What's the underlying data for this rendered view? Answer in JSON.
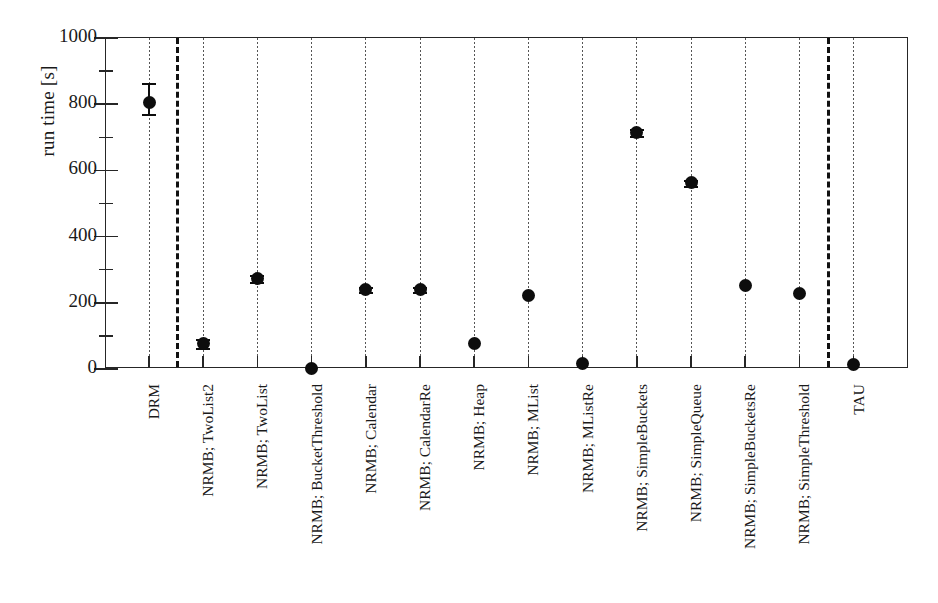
{
  "chart_data": {
    "type": "scatter",
    "title": "",
    "xlabel": "",
    "ylabel": "run time [s]",
    "ylim": [
      0,
      1000
    ],
    "yticks": [
      0,
      200,
      400,
      600,
      800,
      1000
    ],
    "yticks_minor": [
      100,
      300,
      500,
      700,
      900
    ],
    "grid": false,
    "legend": "none",
    "categories": [
      "DRM",
      "NRMB; TwoList2",
      "NRMB; TwoList",
      "NRMB; BucketThreshold",
      "NRMB; Calendar",
      "NRMB; CalendarRe",
      "NRMB; Heap",
      "NRMB; MList",
      "NRMB; MListRe",
      "NRMB; SimpleBuckets",
      "NRMB; SimpleQueue",
      "NRMB; SimpleBucketsRe",
      "NRMB; SimpleThreshold",
      "TAU"
    ],
    "values": [
      805,
      77,
      273,
      3,
      240,
      240,
      77,
      222,
      18,
      715,
      562,
      252,
      227,
      15
    ],
    "err_low": [
      35,
      14,
      10,
      0,
      8,
      8,
      0,
      0,
      0,
      10,
      8,
      0,
      0,
      0
    ],
    "err_high": [
      58,
      14,
      10,
      0,
      8,
      8,
      0,
      0,
      0,
      10,
      8,
      0,
      0,
      0
    ],
    "separators_after": [
      "DRM",
      "NRMB; SimpleThreshold"
    ],
    "marker": "filled-circle",
    "guideline_style": "dotted"
  },
  "colors": {
    "axis": "#262626",
    "marker": "#0d0d0d",
    "separator": "#111111",
    "guide": "#555555",
    "background": "#ffffff"
  }
}
